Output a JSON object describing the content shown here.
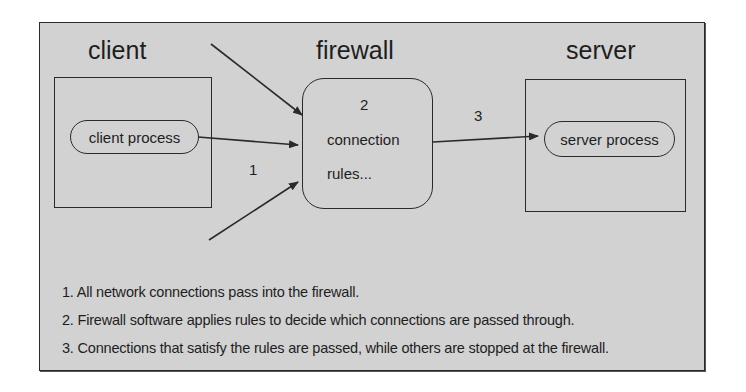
{
  "diagram": {
    "title_labels": {
      "client": "client",
      "firewall": "firewall",
      "server": "server"
    },
    "client_process": "client process",
    "server_process": "server process",
    "firewall_box": {
      "step": "2",
      "line1": "connection",
      "line2": "rules..."
    },
    "step_labels": {
      "incoming": "1",
      "outgoing": "3"
    },
    "notes": [
      "1. All network connections pass into the firewall.",
      "2. Firewall software applies rules to decide which connections are passed through.",
      "3. Connections that satisfy the rules are passed, while others are stopped at the firewall."
    ],
    "colors": {
      "background": "#d2d2d2",
      "stroke": "#2a2a2a",
      "text": "#1e1e1e"
    }
  }
}
